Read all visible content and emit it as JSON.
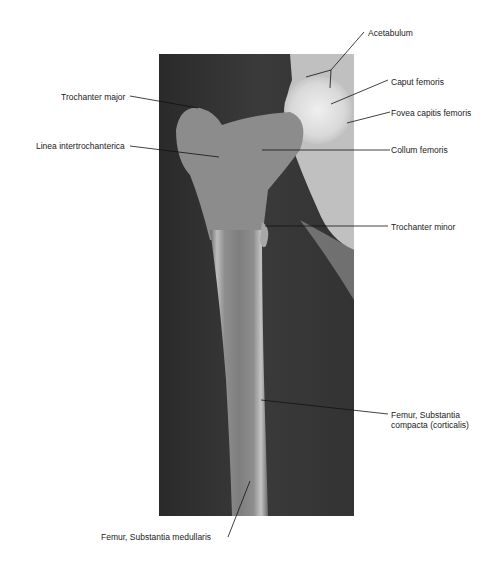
{
  "figure": {
    "type": "radiograph",
    "labels": {
      "acetabulum": "Acetabulum",
      "caput_femoris": "Caput femoris",
      "fovea": "Fovea capitis femoris",
      "collum": "Collum femoris",
      "trochanter_major": "Trochanter major",
      "linea": "Linea intertrochanterica",
      "trochanter_minor": "Trochanter minor",
      "compacta_1": "Femur, Substantia",
      "compacta_2": "compacta (corticalis)",
      "medullaris": "Femur, Substantia medullaris"
    }
  }
}
